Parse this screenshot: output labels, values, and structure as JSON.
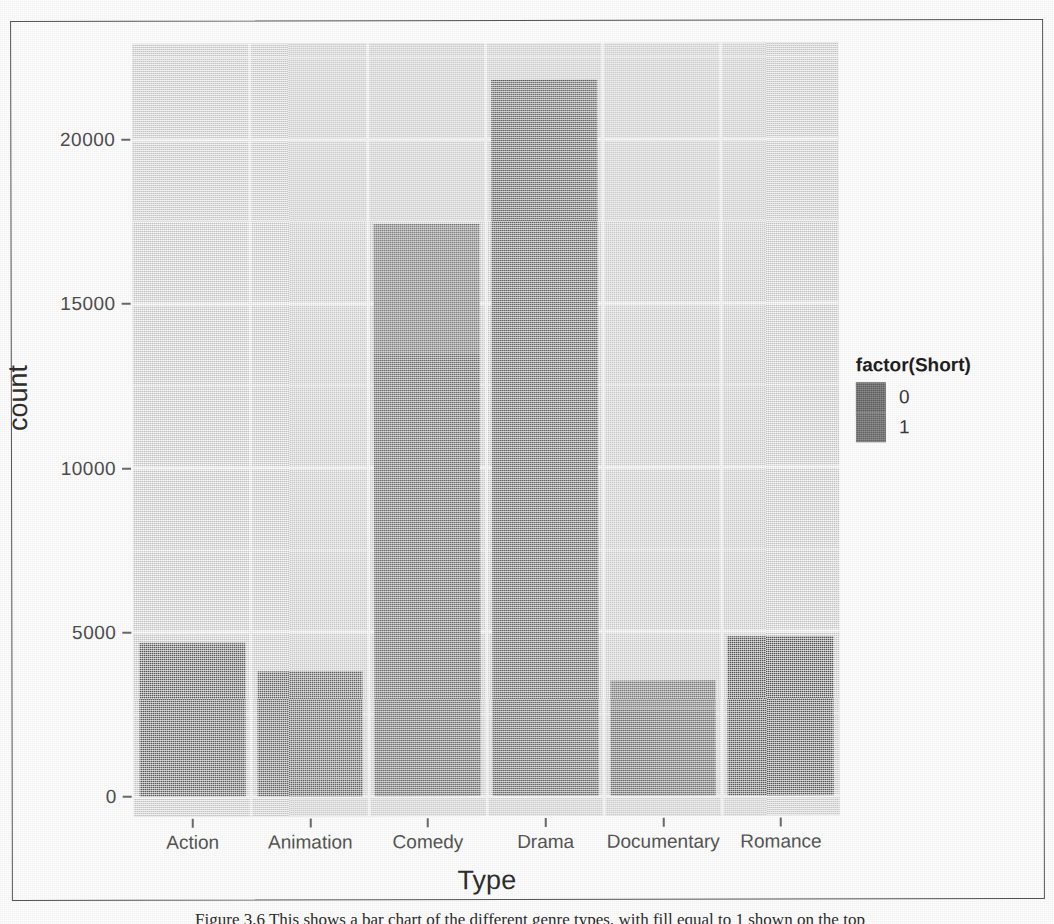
{
  "figure": {
    "caption": "Figure 3.6 This shows a bar chart of the different genre types, with fill equal to 1 shown on the top"
  },
  "chart_data": {
    "type": "bar",
    "subtype": "stacked",
    "title": "",
    "xlabel": "Type",
    "ylabel": "count",
    "categories": [
      "Action",
      "Animation",
      "Comedy",
      "Drama",
      "Documentary",
      "Romance"
    ],
    "ylim": [
      0,
      22800
    ],
    "yticks": [
      0,
      5000,
      10000,
      15000,
      20000
    ],
    "ytick_labels": [
      "0",
      "5000",
      "10000",
      "15000",
      "20000"
    ],
    "grid": true,
    "legend_title": "factor(Short)",
    "legend_position": "right",
    "series": [
      {
        "name": "0",
        "color": "#6f6f6f",
        "values": [
          4660,
          560,
          13500,
          20750,
          2660,
          4830
        ]
      },
      {
        "name": "1",
        "color": "#757575",
        "values": [
          40,
          3240,
          3900,
          1050,
          840,
          20
        ]
      }
    ],
    "totals": [
      4700,
      3800,
      17400,
      21800,
      3500,
      4850
    ]
  },
  "axes": {
    "y": {
      "label": "count",
      "ticks": [
        {
          "value": 0,
          "label": "0"
        },
        {
          "value": 5000,
          "label": "5000"
        },
        {
          "value": 10000,
          "label": "10000"
        },
        {
          "value": 15000,
          "label": "15000"
        },
        {
          "value": 20000,
          "label": "20000"
        }
      ]
    },
    "x": {
      "label": "Type",
      "ticks": [
        {
          "label": "Action"
        },
        {
          "label": "Animation"
        },
        {
          "label": "Comedy"
        },
        {
          "label": "Drama"
        },
        {
          "label": "Documentary"
        },
        {
          "label": "Romance"
        }
      ]
    }
  },
  "legend": {
    "title": "factor(Short)",
    "items": [
      {
        "label": "0",
        "color": "#6f6f6f"
      },
      {
        "label": "1",
        "color": "#757575"
      }
    ]
  },
  "style": {
    "panel_background": "#dedede",
    "gridline_color": "#ffffff",
    "frame_color": "#55565a",
    "text_color": "#2e2e2e"
  }
}
